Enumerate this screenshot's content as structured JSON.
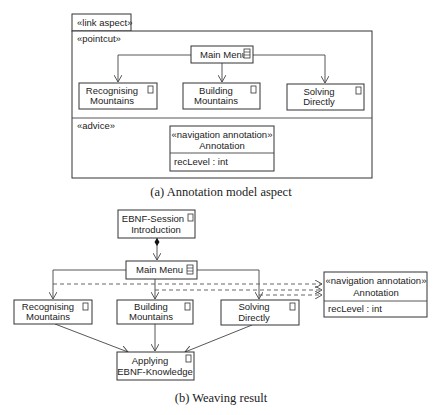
{
  "part_a": {
    "caption": "(a) Annotation model aspect",
    "aspect_label": "«link aspect»",
    "pointcut_label": "«pointcut»",
    "advice_label": "«advice»",
    "main_menu": "Main Menu",
    "nodes": [
      {
        "line1": "Recognising",
        "line2": "Mountains"
      },
      {
        "line1": "Building",
        "line2": "Mountains"
      },
      {
        "line1": "Solving",
        "line2": "Directly"
      }
    ],
    "annotation": {
      "stereotype": "«navigation annotation»",
      "name": "Annotation",
      "attribute": "recLevel : int"
    }
  },
  "part_b": {
    "caption": "(b) Weaving result",
    "session": {
      "line1": "EBNF-Session",
      "line2": "Introduction"
    },
    "main_menu": "Main Menu",
    "nodes": [
      {
        "line1": "Recognising",
        "line2": "Mountains"
      },
      {
        "line1": "Building",
        "line2": "Mountains"
      },
      {
        "line1": "Solving",
        "line2": "Directly"
      }
    ],
    "target": {
      "line1": "Applying",
      "line2": "EBNF-Knowledge"
    },
    "annotation": {
      "stereotype": "«navigation annotation»",
      "name": "Annotation",
      "attribute": "recLevel : int"
    }
  }
}
